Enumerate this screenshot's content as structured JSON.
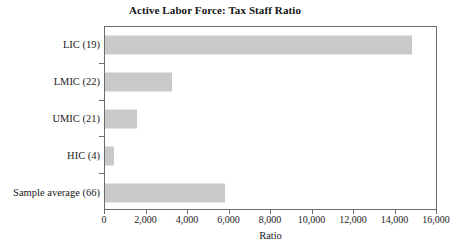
{
  "chart_data": {
    "type": "bar",
    "orientation": "horizontal",
    "title": "Active Labor Force: Tax Staff Ratio",
    "xlabel": "Ratio",
    "ylabel": "",
    "categories": [
      "LIC (19)",
      "LMIC (22)",
      "UMIC (21)",
      "HIC (4)",
      "Sample average (66)"
    ],
    "values": [
      14850,
      3220,
      1540,
      430,
      5820
    ],
    "xlim": [
      0,
      16000
    ],
    "xticks": [
      0,
      2000,
      4000,
      6000,
      8000,
      10000,
      12000,
      14000,
      16000
    ],
    "xtick_labels": [
      "0",
      "2,000",
      "4,000",
      "6,000",
      "8,000",
      "10,000",
      "12,000",
      "14,000",
      "16,000"
    ],
    "grid": false,
    "legend": false,
    "bar_color": "#c9c9c9",
    "frame_color": "#6b6b6b",
    "text_color": "#1a1a1a"
  }
}
